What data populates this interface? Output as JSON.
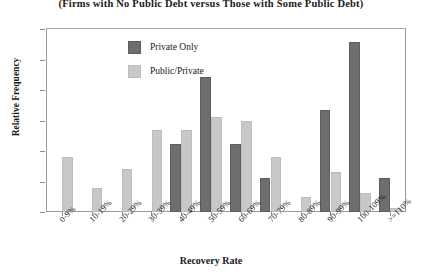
{
  "chart_data": {
    "type": "bar",
    "title": "(Firms with No Public Debt versus Those with Some Public Debt)",
    "xlabel": "Recovery Rate",
    "ylabel": "Relative Frequency",
    "ylim": [
      0,
      30
    ],
    "ytick_labels": [
      "0%",
      "5%",
      "10%",
      "15%",
      "20%",
      "25%",
      "30%"
    ],
    "ytick_values": [
      0,
      5,
      10,
      15,
      20,
      25,
      30
    ],
    "grid": false,
    "legend_position": "upper-left-inside",
    "categories": [
      "0-9%",
      "10-19%",
      "20-29%",
      "30-39%",
      "40-49%",
      "50-59%",
      "60-69%",
      "70-79%",
      "80-89%",
      "90-99%",
      "100-109%",
      ">=110%"
    ],
    "series": [
      {
        "name": "Private Only",
        "color": "#6e6e6e",
        "values": [
          0,
          0,
          0,
          0,
          11.1,
          22.2,
          11.1,
          5.6,
          0,
          16.7,
          27.8,
          5.6
        ]
      },
      {
        "name": "Public/Private",
        "color": "#c8c8c8",
        "values": [
          9.1,
          3.9,
          7.1,
          13.4,
          13.4,
          15.6,
          15.0,
          9.1,
          2.4,
          6.5,
          3.1,
          0.6
        ]
      }
    ]
  }
}
